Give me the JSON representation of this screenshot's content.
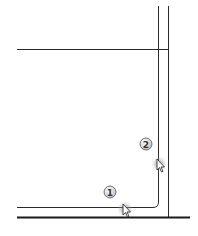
{
  "diagram": {
    "colors": {
      "line": "#2a2a2a",
      "thick_line": "#1a1a1a",
      "badge_fill": "#e8e8e8",
      "badge_stroke": "#555555",
      "cursor_glow": "#9a9a9a"
    },
    "steps": [
      {
        "label": "1"
      },
      {
        "label": "2"
      }
    ]
  }
}
